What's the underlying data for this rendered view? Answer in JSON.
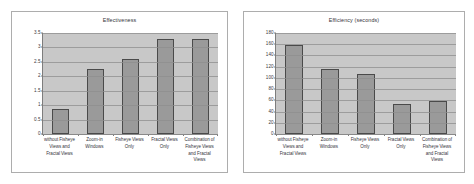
{
  "charts": [
    {
      "id": "effectiveness",
      "chart_data": {
        "type": "bar",
        "title": "Effectiveness",
        "xlabel": "",
        "ylabel": "",
        "ylim": [
          0,
          3.5
        ],
        "yticks": [
          "3.5",
          "3",
          "2.5",
          "2",
          "1.5",
          "1",
          "0.5",
          "0"
        ],
        "ytick_values": [
          3.5,
          3,
          2.5,
          2,
          1.5,
          1,
          0.5,
          0
        ],
        "grid": true,
        "legend": false,
        "categories": [
          "without Fisheye Views and Fractal Views",
          "Zoom-in Windows",
          "Fisheye Views Only",
          "Fractal Views Only",
          "Combination of Fisheye Views and Fractal Views"
        ],
        "values": [
          0.88,
          2.25,
          2.6,
          3.3,
          3.3
        ],
        "bar_color": "#9a9a9a",
        "plot_bg": "#c8c8c8"
      }
    },
    {
      "id": "efficiency",
      "chart_data": {
        "type": "bar",
        "title": "Efficiency (seconds)",
        "xlabel": "",
        "ylabel": "",
        "ylim": [
          0,
          180
        ],
        "yticks": [
          "180",
          "160",
          "140",
          "120",
          "100",
          "80",
          "60",
          "40",
          "20",
          "0"
        ],
        "ytick_values": [
          180,
          160,
          140,
          120,
          100,
          80,
          60,
          40,
          20,
          0
        ],
        "grid": true,
        "legend": false,
        "categories": [
          "without Fisheye Views and Fractal Views",
          "Zoom-in Windows",
          "Fisheye Views Only",
          "Fractal Views Only",
          "Combination of Fisheye Views and Fractal Views"
        ],
        "values": [
          158,
          115,
          107,
          53,
          58
        ],
        "bar_color": "#9a9a9a",
        "plot_bg": "#c8c8c8"
      }
    }
  ]
}
